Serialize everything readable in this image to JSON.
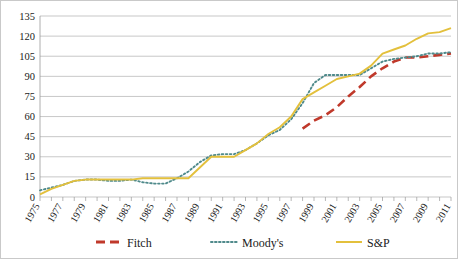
{
  "chart_data": {
    "type": "line",
    "title": "",
    "xlabel": "",
    "ylabel": "",
    "xlim": [
      1975,
      2011
    ],
    "ylim": [
      0,
      135
    ],
    "yticks": [
      0,
      15,
      30,
      45,
      60,
      75,
      90,
      105,
      120,
      135
    ],
    "grid": true,
    "legend_position": "bottom",
    "x": [
      1975,
      1976,
      1977,
      1978,
      1979,
      1980,
      1981,
      1982,
      1983,
      1984,
      1985,
      1986,
      1987,
      1988,
      1989,
      1990,
      1991,
      1992,
      1993,
      1994,
      1995,
      1996,
      1997,
      1998,
      1999,
      2000,
      2001,
      2002,
      2003,
      2004,
      2005,
      2006,
      2007,
      2008,
      2009,
      2010,
      2011
    ],
    "xtick_labels": [
      "1975",
      "1977",
      "1979",
      "1981",
      "1983",
      "1985",
      "1987",
      "1989",
      "1991",
      "1993",
      "1995",
      "1997",
      "1999",
      "2001",
      "2003",
      "2005",
      "2007",
      "2009",
      "2011"
    ],
    "series": [
      {
        "name": "Fitch",
        "color": "#C0392B",
        "style": "dashed",
        "values": [
          null,
          null,
          null,
          null,
          null,
          null,
          null,
          null,
          null,
          null,
          null,
          null,
          null,
          null,
          null,
          null,
          null,
          null,
          null,
          null,
          null,
          null,
          null,
          51,
          57,
          61,
          67,
          75,
          82,
          90,
          96,
          101,
          104,
          104,
          105,
          106,
          107
        ]
      },
      {
        "name": "Moody's",
        "color": "#4F8A8B",
        "style": "dotted",
        "values": [
          5,
          7,
          9,
          12,
          13,
          13,
          12,
          12,
          13,
          11,
          10,
          10,
          14,
          19,
          26,
          31,
          32,
          32,
          35,
          40,
          46,
          50,
          58,
          70,
          85,
          91,
          91,
          91,
          91,
          96,
          101,
          103,
          104,
          105,
          107,
          107,
          108
        ]
      },
      {
        "name": "S&P",
        "color": "#E3C03C",
        "style": "solid",
        "values": [
          2,
          6,
          9,
          12,
          13,
          13,
          13,
          13,
          13,
          14,
          14,
          14,
          14,
          14,
          22,
          30,
          30,
          30,
          35,
          40,
          47,
          52,
          60,
          73,
          78,
          83,
          88,
          90,
          92,
          98,
          107,
          110,
          113,
          118,
          122,
          123,
          126
        ]
      }
    ]
  },
  "legend": {
    "items": [
      {
        "label": "Fitch",
        "marker": "dashed-line-marker"
      },
      {
        "label": "Moody's",
        "marker": "dotted-line-marker"
      },
      {
        "label": "S&P",
        "marker": "solid-line-marker"
      }
    ]
  }
}
